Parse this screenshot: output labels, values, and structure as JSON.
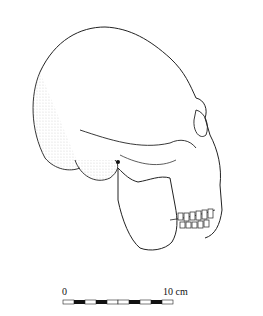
{
  "figure": {
    "scale_bar": {
      "start_label": "0",
      "end_label": "10 cm",
      "segments": 10,
      "pattern": [
        "white",
        "black",
        "white",
        "black",
        "white",
        "white",
        "black",
        "white",
        "black",
        "white"
      ]
    }
  }
}
